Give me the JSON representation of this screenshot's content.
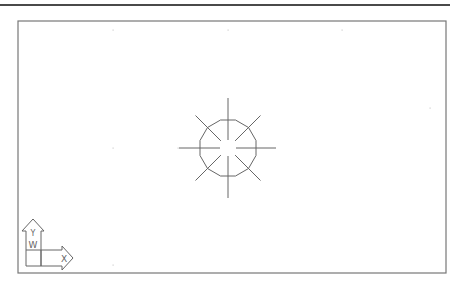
{
  "app": {
    "type": "cad-model-space-viewport"
  },
  "viewport": {
    "frame": {
      "x1": 18,
      "y1": 21,
      "x2": 446,
      "y2": 273,
      "stroke": "#777777"
    },
    "top_rule": {
      "x1": 0,
      "x2": 450,
      "y": 5,
      "color": "#4a4a4a"
    },
    "background": "#ffffff"
  },
  "grid": {
    "dot_color": "#cfcfcf",
    "dots": [
      [
        113,
        30
      ],
      [
        228,
        30
      ],
      [
        342,
        30
      ],
      [
        113,
        148
      ],
      [
        178,
        148
      ],
      [
        430,
        108
      ],
      [
        113,
        265
      ]
    ]
  },
  "drawing": {
    "entity": "star-symbol",
    "center": [
      228,
      148
    ],
    "stroke": "#666666",
    "polygon": {
      "sides": 12,
      "radius": 29
    },
    "spokes": [
      {
        "angle": 0,
        "inner": 8,
        "outer": 48
      },
      {
        "angle": 45,
        "inner": 10,
        "outer": 46
      },
      {
        "angle": 90,
        "inner": 8,
        "outer": 50
      },
      {
        "angle": 135,
        "inner": 10,
        "outer": 46
      },
      {
        "angle": 180,
        "inner": 8,
        "outer": 49
      },
      {
        "angle": 225,
        "inner": 10,
        "outer": 46
      },
      {
        "angle": 270,
        "inner": 8,
        "outer": 50
      },
      {
        "angle": 315,
        "inner": 10,
        "outer": 46
      }
    ]
  },
  "ucs_icon": {
    "x_label": "X",
    "y_label": "Y",
    "w_label": "W",
    "stroke": "#666666"
  }
}
